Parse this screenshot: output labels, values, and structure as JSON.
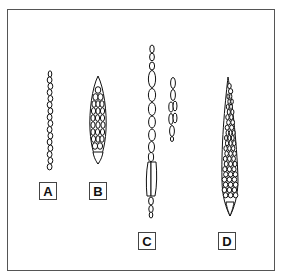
{
  "figure": {
    "panels": [
      {
        "label": "A",
        "type": "uniseriate ray"
      },
      {
        "label": "B",
        "type": "multiseriate spindle ray"
      },
      {
        "label": "C",
        "type": "uniseriate/biseriate rays with tall cells"
      },
      {
        "label": "D",
        "type": "tall multiseriate spindle ray"
      }
    ],
    "line_color": "#111111",
    "frame_color": "#555555"
  }
}
